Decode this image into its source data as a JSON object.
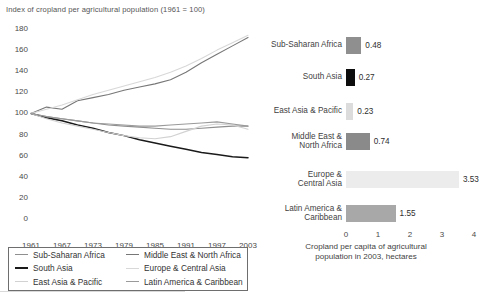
{
  "figure": {
    "line_chart": {
      "title": "Index of cropland per agricultural population (1961 = 100)"
    },
    "bar_chart": {
      "axis_title_line1": "Cropland per capita of agricultural",
      "axis_title_line2": "population in 2003, hectares"
    },
    "legend": {
      "items": [
        {
          "label": "Sub-Saharan Africa",
          "color": "#8f8f8f"
        },
        {
          "label": "South Asia",
          "color": "#1a1a1a"
        },
        {
          "label": "East Asia & Pacific",
          "color": "#d2d2d2"
        },
        {
          "label": "Middle East & North Africa",
          "color": "#777777"
        },
        {
          "label": "Europe & Central Asia",
          "color": "#d8d8d8"
        },
        {
          "label": "Latin America & Caribbean",
          "color": "#9a9a9a"
        }
      ]
    },
    "source_note": ""
  },
  "chart_data": [
    {
      "type": "line",
      "title": "Index of cropland per agricultural population (1961 = 100)",
      "xlabel": "",
      "ylabel": "Index (1961 = 100)",
      "xlim": [
        1961,
        2003
      ],
      "ylim": [
        0,
        180
      ],
      "yticks": [
        0,
        20,
        40,
        60,
        80,
        100,
        120,
        140,
        160,
        180
      ],
      "xticks": [
        1961,
        1967,
        1973,
        1979,
        1985,
        1991,
        1997,
        2003
      ],
      "grid": false,
      "legend_position": "below-left",
      "x": [
        1961,
        1964,
        1967,
        1970,
        1973,
        1976,
        1979,
        1982,
        1985,
        1988,
        1991,
        1994,
        1997,
        2000,
        2003
      ],
      "series": [
        {
          "name": "Sub-Saharan Africa",
          "color": "#8f8f8f",
          "values": [
            100,
            97,
            95,
            93,
            91,
            89,
            88,
            87,
            86,
            85,
            85,
            86,
            87,
            88,
            88
          ]
        },
        {
          "name": "South Asia",
          "color": "#1a1a1a",
          "values": [
            100,
            96,
            93,
            89,
            86,
            82,
            79,
            75,
            72,
            69,
            66,
            63,
            61,
            59,
            58
          ]
        },
        {
          "name": "East Asia & Pacific",
          "color": "#d2d2d2",
          "values": [
            100,
            95,
            91,
            88,
            85,
            82,
            79,
            77,
            76,
            78,
            83,
            88,
            90,
            89,
            85
          ]
        },
        {
          "name": "Middle East & North Africa",
          "color": "#777777",
          "values": [
            100,
            106,
            104,
            112,
            115,
            118,
            122,
            125,
            128,
            132,
            139,
            148,
            156,
            164,
            172
          ]
        },
        {
          "name": "Europe & Central Asia",
          "color": "#d8d8d8",
          "values": [
            100,
            104,
            108,
            113,
            118,
            122,
            126,
            130,
            134,
            139,
            145,
            152,
            160,
            167,
            174
          ]
        },
        {
          "name": "Latin America & Caribbean",
          "color": "#9a9a9a",
          "values": [
            100,
            97,
            95,
            93,
            91,
            90,
            89,
            88,
            88,
            89,
            90,
            91,
            92,
            90,
            88
          ]
        }
      ]
    },
    {
      "type": "bar",
      "orientation": "horizontal",
      "title": "",
      "xlabel": "Cropland per capita of agricultural population in 2003, hectares",
      "ylabel": "",
      "xlim": [
        0,
        4
      ],
      "xticks": [
        0,
        1,
        2,
        3,
        4
      ],
      "grid": false,
      "categories": [
        "Sub-Saharan Africa",
        "South Asia",
        "East Asia & Pacific",
        "Middle East & North Africa",
        "Europe & Central Asia",
        "Latin America & Caribbean"
      ],
      "values": [
        0.48,
        0.27,
        0.23,
        0.74,
        3.53,
        1.55
      ],
      "value_labels": [
        "0.48",
        "0.27",
        "0.23",
        "0.74",
        "3.53",
        "1.55"
      ],
      "colors": [
        "#8f8f8f",
        "#0d0d0d",
        "#dcdcdc",
        "#8a8a8a",
        "#ececec",
        "#a8a8a8"
      ],
      "category_label_lines": [
        [
          "Sub-Saharan Africa"
        ],
        [
          "South Asia"
        ],
        [
          "East Asia & Pacific"
        ],
        [
          "Middle East &",
          "North Africa"
        ],
        [
          "Europe &",
          "Central Asia"
        ],
        [
          "Latin America &",
          "Caribbean"
        ]
      ]
    }
  ]
}
